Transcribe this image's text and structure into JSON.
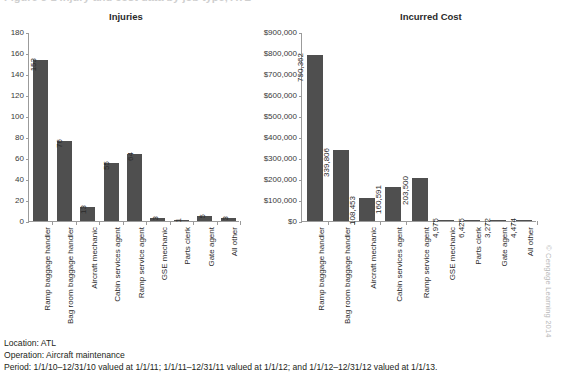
{
  "caption": {
    "text": "Figure 5-1  Injury and cost data by job type, ATL"
  },
  "footnotes": {
    "location": "Location: ATL",
    "operation": "Operation: Aircraft maintenance",
    "period": "Period: 1/1/10–12/31/10 valued at 1/1/11; 1/1/11–12/31/11 valued at 1/1/12; and 1/1/12–12/31/12 valued at 1/1/13."
  },
  "copyright": "© Cengage Learning 2014",
  "chart_data": [
    {
      "type": "bar",
      "title": "Injuries",
      "xlabel": "",
      "ylabel": "",
      "ylim": [
        0,
        180
      ],
      "yticks": [
        0,
        20,
        40,
        60,
        80,
        100,
        120,
        140,
        160,
        180
      ],
      "ytick_labels": [
        "0",
        "20",
        "40",
        "60",
        "80",
        "100",
        "120",
        "140",
        "160",
        "180"
      ],
      "grid": false,
      "legend": "none",
      "bar_color": "#4f4f4f",
      "categories": [
        "Ramp baggage handler",
        "Bag room baggage handler",
        "Aircraft mechanic",
        "Cabin services agent",
        "Ramp service agent",
        "GSE mechanic",
        "Parts clerk",
        "Gate agent",
        "All other"
      ],
      "values": [
        153,
        76,
        13,
        55,
        64,
        3,
        1,
        5,
        3
      ],
      "value_labels": [
        "153",
        "76",
        "13",
        "55",
        "64",
        "3",
        "1",
        "5",
        "3"
      ]
    },
    {
      "type": "bar",
      "title": "Incurred Cost",
      "xlabel": "",
      "ylabel": "",
      "ylim": [
        0,
        900000
      ],
      "yticks": [
        0,
        100000,
        200000,
        300000,
        400000,
        500000,
        600000,
        700000,
        800000,
        900000
      ],
      "ytick_labels": [
        "$0",
        "$100,000",
        "$200,000",
        "$300,000",
        "$400,000",
        "$500,000",
        "$600,000",
        "$700,000",
        "$800,000",
        "$900,000"
      ],
      "grid": false,
      "legend": "none",
      "bar_color": "#4f4f4f",
      "categories": [
        "Ramp baggage handler",
        "Bag room baggage handler",
        "Aircraft mechanic",
        "Cabin services agent",
        "Ramp service agent",
        "GSE mechanic",
        "Parts clerk",
        "Gate agent",
        "All other"
      ],
      "values": [
        790362,
        339806,
        108453,
        160591,
        203500,
        4975,
        6425,
        3272,
        4474
      ],
      "value_labels": [
        "790,362",
        "339,806",
        "108,453",
        "160,591",
        "203,500",
        "4,975",
        "6,425",
        "3,272",
        "4,474"
      ]
    }
  ]
}
